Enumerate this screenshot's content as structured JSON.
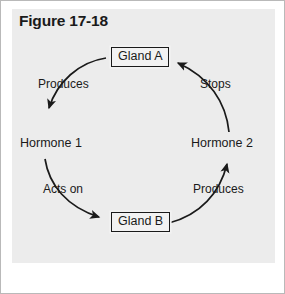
{
  "figure": {
    "title": "Figure 17-18",
    "panel_color": "#ececec",
    "frame_color": "#b9b9b9",
    "ink_color": "#1a1a1a"
  },
  "diagram": {
    "type": "cycle",
    "direction": "clockwise",
    "nodes": [
      {
        "id": "gland-a",
        "label": "Gland A",
        "shape": "box",
        "position": "top"
      },
      {
        "id": "hormone-1",
        "label": "Hormone 1",
        "shape": "text",
        "position": "left"
      },
      {
        "id": "gland-b",
        "label": "Gland B",
        "shape": "box",
        "position": "bottom"
      },
      {
        "id": "hormone-2",
        "label": "Hormone 2",
        "shape": "text",
        "position": "right"
      }
    ],
    "edges": [
      {
        "id": "produces-1",
        "label": "Produces",
        "from": "gland-a",
        "to": "hormone-1",
        "side": "upper-left"
      },
      {
        "id": "acts-on",
        "label": "Acts on",
        "from": "hormone-1",
        "to": "gland-b",
        "side": "lower-left"
      },
      {
        "id": "produces-2",
        "label": "Produces",
        "from": "gland-b",
        "to": "hormone-2",
        "side": "lower-right"
      },
      {
        "id": "stops",
        "label": "Stops",
        "from": "hormone-2",
        "to": "gland-a",
        "side": "upper-right"
      }
    ]
  }
}
